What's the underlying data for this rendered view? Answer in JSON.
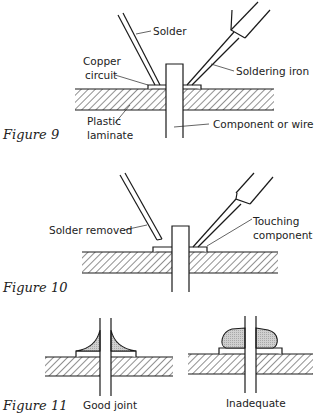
{
  "figures": [
    {
      "caption": "Figure 9",
      "labels": {
        "solder": "Solder",
        "copper_line1": "Copper",
        "copper_line2": "circuit",
        "iron": "Soldering iron",
        "plastic_line1": "Plastic",
        "plastic_line2": "laminate",
        "component": "Component or wire"
      }
    },
    {
      "caption": "Figure 10",
      "labels": {
        "solder_removed": "Solder removed",
        "touching_line1": "Touching",
        "touching_line2": "component"
      }
    },
    {
      "caption": "Figure 11",
      "labels": {
        "good": "Good joint",
        "inadequate": "Inadequate"
      }
    }
  ],
  "colors": {
    "line": "#1a1a1a",
    "solder_fill": "#c8c8c8",
    "background": "#ffffff"
  }
}
